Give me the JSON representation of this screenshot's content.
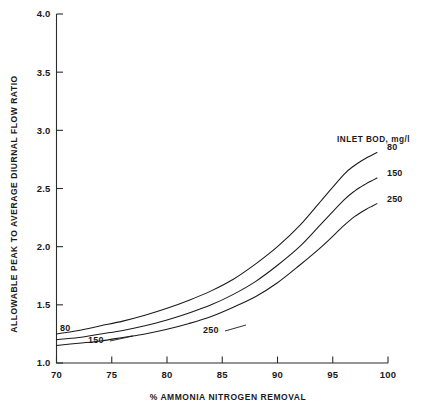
{
  "chart_data": {
    "type": "line",
    "title": "",
    "xlabel": "% AMMONIA NITROGEN REMOVAL",
    "ylabel": "ALLOWABLE PEAK TO AVERAGE DIURNAL FLOW RATIO",
    "xlim": [
      70,
      100
    ],
    "ylim": [
      1.0,
      4.0
    ],
    "xticks": [
      70,
      75,
      80,
      85,
      90,
      95,
      100
    ],
    "xticklabels": [
      "70",
      "75",
      "80",
      "85",
      "90",
      "95",
      "100"
    ],
    "yticks": [
      1.0,
      1.5,
      2.0,
      2.5,
      3.0,
      3.5,
      4.0
    ],
    "yticklabels": [
      "1.0",
      "1.5",
      "2.0",
      "2.5",
      "3.0",
      "3.5",
      "4.0"
    ],
    "grid": false,
    "legend_title": "INLET BOD, mg/l",
    "legend_position": "inline-right",
    "series": [
      {
        "name": "80",
        "label_left": "80",
        "label_right": "80",
        "x": [
          70,
          72,
          74,
          76,
          78,
          80,
          82,
          84,
          86,
          88,
          90,
          92,
          94,
          96,
          97,
          98,
          98.6,
          99
        ],
        "y": [
          1.25,
          1.28,
          1.32,
          1.36,
          1.41,
          1.47,
          1.54,
          1.62,
          1.72,
          1.85,
          2.0,
          2.18,
          2.4,
          2.62,
          2.7,
          2.76,
          2.79,
          2.81
        ]
      },
      {
        "name": "150",
        "label_left": "150",
        "label_right": "150",
        "x": [
          70,
          72,
          74,
          76,
          78,
          80,
          82,
          84,
          86,
          88,
          90,
          92,
          94,
          96,
          97,
          98,
          98.6,
          99
        ],
        "y": [
          1.2,
          1.22,
          1.25,
          1.28,
          1.32,
          1.37,
          1.43,
          1.5,
          1.59,
          1.7,
          1.84,
          2.0,
          2.2,
          2.4,
          2.48,
          2.54,
          2.57,
          2.59
        ]
      },
      {
        "name": "250",
        "label_left": "250",
        "label_right": "250",
        "x": [
          70,
          72,
          74,
          76,
          78,
          80,
          82,
          84,
          86,
          88,
          90,
          92,
          94,
          96,
          97,
          98,
          98.6,
          99
        ],
        "y": [
          1.15,
          1.17,
          1.19,
          1.22,
          1.25,
          1.29,
          1.34,
          1.4,
          1.48,
          1.57,
          1.69,
          1.84,
          2.0,
          2.18,
          2.26,
          2.32,
          2.35,
          2.37
        ]
      }
    ]
  },
  "axes": {
    "x_title": "% AMMONIA NITROGEN REMOVAL",
    "y_title": "ALLOWABLE PEAK TO AVERAGE DIURNAL FLOW RATIO"
  },
  "legend": {
    "title": "INLET BOD, mg/l",
    "entries": [
      "80",
      "150",
      "250"
    ]
  },
  "ticks": {
    "x": [
      "70",
      "75",
      "80",
      "85",
      "90",
      "95",
      "100"
    ],
    "y": [
      "1.0",
      "1.5",
      "2.0",
      "2.5",
      "3.0",
      "3.5",
      "4.0"
    ]
  },
  "inline_labels": {
    "left": [
      "80",
      "150",
      "250"
    ],
    "right": [
      "80",
      "150",
      "250"
    ]
  },
  "colors": {
    "background": "#ffffff",
    "ink": "#1a1a1a",
    "axis": "#2b2b2b"
  }
}
